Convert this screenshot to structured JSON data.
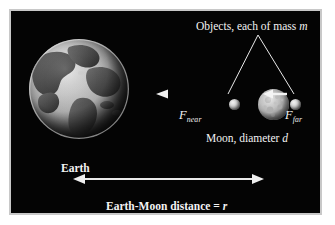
{
  "figure": {
    "type": "physics-diagram",
    "background_color": "#040404",
    "frame_color": "#c8c8c8",
    "text_color": "#f3f3f3"
  },
  "labels": {
    "objects": {
      "prefix": "Objects, each of mass ",
      "symbol": "m"
    },
    "force_near": {
      "symbol": "F",
      "subscript": "near"
    },
    "force_far": {
      "symbol": "F",
      "subscript": "far"
    },
    "moon": {
      "prefix": "Moon, diameter ",
      "symbol": "d"
    },
    "earth": {
      "text": "Earth"
    },
    "distance": {
      "prefix": "Earth-Moon distance = ",
      "symbol": "r"
    }
  },
  "bodies": {
    "earth": {
      "name": "Earth",
      "center_x": 77,
      "center_y": 87,
      "radius": 50
    },
    "moon": {
      "name": "Moon",
      "center_x": 262,
      "center_y": 93,
      "radius": 15
    },
    "object_near": {
      "name": "near mass",
      "center_x": 223,
      "center_y": 93,
      "radius": 5
    },
    "object_far": {
      "name": "far mass",
      "center_x": 284,
      "center_y": 93,
      "radius": 5
    }
  },
  "arrows": {
    "force_near": {
      "direction": "left",
      "from_x": 218,
      "to_x": 148,
      "y": 93
    },
    "force_far": {
      "direction": "left",
      "from_x": 277,
      "to_x": 259,
      "y": 93
    },
    "distance": {
      "direction": "both",
      "from_x": 72,
      "to_x": 245,
      "y": 178
    }
  },
  "leader_lines": {
    "apex_x": 247,
    "apex_y": 24,
    "left_end_x": 217,
    "left_end_y": 84,
    "right_end_x": 283,
    "right_end_y": 84
  }
}
